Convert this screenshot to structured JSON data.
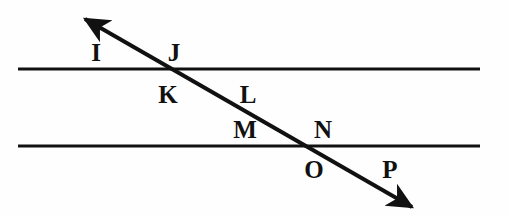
{
  "figure": {
    "kind": "geometry-diagram",
    "background_color": "#fefefe",
    "stroke_color": "#111111",
    "label_color": "#111111",
    "canvas": {
      "width": 509,
      "height": 216
    }
  },
  "lines": [
    {
      "name": "upper-parallel-line",
      "type": "segment",
      "x1": 18,
      "y1": 69,
      "x2": 480,
      "y2": 69,
      "stroke_width": 3
    },
    {
      "name": "lower-parallel-line",
      "type": "segment",
      "x1": 18,
      "y1": 146,
      "x2": 480,
      "y2": 146,
      "stroke_width": 3
    },
    {
      "name": "transversal-line",
      "type": "double-arrow",
      "x1": 85,
      "y1": 19,
      "x2": 412,
      "y2": 207,
      "stroke_width": 4,
      "arrow_start": true,
      "arrow_end": true
    }
  ],
  "intersections": [
    {
      "name": "upper-intersection",
      "x": 171,
      "y": 69
    },
    {
      "name": "lower-intersection",
      "x": 314,
      "y": 146
    }
  ],
  "labels": [
    {
      "id": "I",
      "text": "I",
      "x": 96,
      "y": 52,
      "position": "upper-left-above"
    },
    {
      "id": "J",
      "text": "J",
      "x": 174,
      "y": 52,
      "position": "upper-right-above"
    },
    {
      "id": "K",
      "text": "K",
      "x": 168,
      "y": 94,
      "position": "upper-left-below"
    },
    {
      "id": "L",
      "text": "L",
      "x": 248,
      "y": 94,
      "position": "upper-right-below"
    },
    {
      "id": "M",
      "text": "M",
      "x": 245,
      "y": 129,
      "position": "lower-left-above"
    },
    {
      "id": "N",
      "text": "N",
      "x": 323,
      "y": 129,
      "position": "lower-right-above"
    },
    {
      "id": "O",
      "text": "O",
      "x": 314,
      "y": 169,
      "position": "lower-left-below"
    },
    {
      "id": "P",
      "text": "P",
      "x": 390,
      "y": 169,
      "position": "lower-right-below"
    }
  ]
}
